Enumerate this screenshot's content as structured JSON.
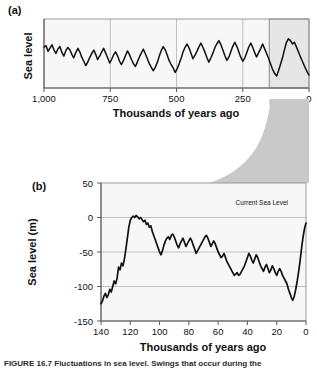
{
  "figure": {
    "caption": "FIGURE 16.7  Fluctuations in sea level. Swings that occur during the"
  },
  "panel_a": {
    "tag": "(a)",
    "ylabel": "Sea level",
    "xlabel": "Thousands of years ago",
    "xticks": [
      "1,000",
      "750",
      "500",
      "250",
      "0"
    ],
    "highlight_note": "detail-region-0-150ka"
  },
  "panel_b": {
    "tag": "(b)",
    "ylabel": "Sea level (m)",
    "xlabel": "Thousands of years ago",
    "xticks": [
      "140",
      "120",
      "100",
      "80",
      "60",
      "40",
      "20",
      "0"
    ],
    "yticks": [
      "50",
      "0",
      "-50",
      "-100",
      "-150"
    ],
    "annotation": "Current Sea Level"
  },
  "colors": {
    "curve": "#111111",
    "plot_background": "#f7f7f7",
    "gridline": "#b9b9b9",
    "frame": "#9a9a9a",
    "funnel": "#c9c9c9"
  },
  "chart_data": [
    {
      "type": "line",
      "id": "panel-a-sea-level-1myr",
      "title": "",
      "xlabel": "Thousands of years ago",
      "ylabel": "Sea level",
      "xlim": [
        1000,
        0
      ],
      "ylim": [
        -140,
        20
      ],
      "xticks": [
        1000,
        750,
        500,
        250,
        0
      ],
      "yticks": [],
      "grid": "vertical",
      "xaxis_reversed": true,
      "legend": "none",
      "highlight_region": [
        150,
        0
      ],
      "x": [
        1000,
        992,
        985,
        978,
        970,
        962,
        955,
        948,
        940,
        932,
        925,
        918,
        910,
        902,
        895,
        888,
        880,
        872,
        865,
        858,
        850,
        842,
        835,
        828,
        820,
        812,
        805,
        798,
        790,
        782,
        775,
        768,
        760,
        752,
        745,
        738,
        730,
        722,
        715,
        708,
        700,
        692,
        685,
        678,
        670,
        662,
        655,
        648,
        640,
        632,
        625,
        618,
        610,
        602,
        595,
        588,
        580,
        572,
        565,
        558,
        550,
        542,
        535,
        528,
        520,
        512,
        505,
        498,
        490,
        482,
        475,
        468,
        460,
        452,
        445,
        438,
        430,
        422,
        415,
        408,
        400,
        392,
        385,
        378,
        370,
        362,
        355,
        348,
        340,
        332,
        325,
        318,
        310,
        302,
        295,
        288,
        280,
        272,
        265,
        258,
        250,
        242,
        235,
        228,
        220,
        212,
        205,
        198,
        190,
        182,
        175,
        168,
        160,
        152,
        145,
        138,
        130,
        122,
        115,
        108,
        100,
        92,
        85,
        78,
        70,
        62,
        55,
        48,
        40,
        32,
        25,
        18,
        12,
        6,
        0
      ],
      "y": [
        -45,
        -42,
        -55,
        -48,
        -40,
        -52,
        -60,
        -50,
        -44,
        -58,
        -66,
        -54,
        -46,
        -52,
        -62,
        -70,
        -58,
        -48,
        -56,
        -68,
        -78,
        -88,
        -80,
        -70,
        -60,
        -52,
        -62,
        -74,
        -66,
        -56,
        -48,
        -58,
        -70,
        -82,
        -74,
        -64,
        -56,
        -66,
        -78,
        -86,
        -76,
        -64,
        -54,
        -62,
        -74,
        -84,
        -90,
        -80,
        -68,
        -58,
        -50,
        -60,
        -72,
        -84,
        -92,
        -100,
        -92,
        -80,
        -66,
        -54,
        -44,
        -52,
        -64,
        -76,
        -86,
        -94,
        -104,
        -96,
        -84,
        -70,
        -56,
        -46,
        -38,
        -48,
        -60,
        -72,
        -64,
        -54,
        -44,
        -36,
        -46,
        -58,
        -70,
        -80,
        -70,
        -58,
        -46,
        -38,
        -30,
        -40,
        -52,
        -64,
        -76,
        -68,
        -56,
        -44,
        -34,
        -44,
        -56,
        -68,
        -78,
        -70,
        -58,
        -46,
        -36,
        -46,
        -58,
        -68,
        -58,
        -48,
        -38,
        -48,
        -60,
        -72,
        -84,
        -96,
        -106,
        -112,
        -100,
        -86,
        -70,
        -50,
        -34,
        -26,
        -30,
        -38,
        -34,
        -44,
        -56,
        -68,
        -78,
        -88,
        -96,
        -104,
        -110,
        -70,
        -24
      ]
    },
    {
      "type": "line",
      "id": "panel-b-sea-level-140ka",
      "title": "",
      "xlabel": "Thousands of years ago",
      "ylabel": "Sea level (m)",
      "xlim": [
        140,
        0
      ],
      "ylim": [
        -150,
        50
      ],
      "xticks": [
        140,
        120,
        100,
        80,
        60,
        40,
        20,
        0
      ],
      "yticks": [
        50,
        0,
        -50,
        -100,
        -150
      ],
      "gridlines_y": [
        0,
        -50,
        -100
      ],
      "grid": "horizontal",
      "xaxis_reversed": true,
      "legend": "none",
      "annotations": [
        {
          "text": "Current Sea Level",
          "x": 12,
          "y": 5
        }
      ],
      "x": [
        140,
        139,
        138,
        137,
        136,
        135,
        134,
        133,
        132,
        131,
        130,
        129,
        128,
        127,
        126,
        125,
        124,
        123,
        122,
        121,
        120,
        119,
        118,
        117,
        116,
        115,
        114,
        113,
        112,
        111,
        110,
        109,
        108,
        107,
        106,
        105,
        104,
        103,
        102,
        101,
        100,
        99,
        98,
        97,
        96,
        95,
        94,
        93,
        92,
        91,
        90,
        89,
        88,
        87,
        86,
        85,
        84,
        83,
        82,
        81,
        80,
        79,
        78,
        77,
        76,
        75,
        74,
        73,
        72,
        71,
        70,
        69,
        68,
        67,
        66,
        65,
        64,
        63,
        62,
        61,
        60,
        59,
        58,
        57,
        56,
        55,
        54,
        53,
        52,
        51,
        50,
        49,
        48,
        47,
        46,
        45,
        44,
        43,
        42,
        41,
        40,
        39,
        38,
        37,
        36,
        35,
        34,
        33,
        32,
        31,
        30,
        29,
        28,
        27,
        26,
        25,
        24,
        23,
        22,
        21,
        20,
        19,
        18,
        17,
        16,
        15,
        14,
        13,
        12,
        11,
        10,
        9,
        8,
        7,
        6,
        5,
        4,
        3,
        2,
        1,
        0
      ],
      "y": [
        -125,
        -121,
        -114,
        -110,
        -116,
        -112,
        -104,
        -108,
        -100,
        -92,
        -96,
        -88,
        -72,
        -76,
        -66,
        -70,
        -60,
        -46,
        -30,
        -14,
        -4,
        0,
        2,
        0,
        3,
        1,
        -2,
        0,
        -3,
        -6,
        -4,
        -10,
        -8,
        -14,
        -12,
        -20,
        -26,
        -32,
        -38,
        -44,
        -50,
        -54,
        -48,
        -40,
        -34,
        -30,
        -28,
        -32,
        -26,
        -24,
        -28,
        -34,
        -40,
        -44,
        -38,
        -34,
        -30,
        -36,
        -42,
        -38,
        -34,
        -30,
        -34,
        -40,
        -46,
        -52,
        -48,
        -44,
        -40,
        -36,
        -32,
        -28,
        -26,
        -30,
        -36,
        -42,
        -38,
        -34,
        -38,
        -44,
        -50,
        -54,
        -58,
        -56,
        -52,
        -58,
        -64,
        -68,
        -72,
        -76,
        -80,
        -84,
        -82,
        -80,
        -84,
        -82,
        -78,
        -74,
        -70,
        -64,
        -58,
        -52,
        -56,
        -62,
        -66,
        -60,
        -54,
        -58,
        -64,
        -70,
        -74,
        -78,
        -72,
        -68,
        -74,
        -80,
        -76,
        -70,
        -74,
        -80,
        -84,
        -78,
        -74,
        -78,
        -84,
        -88,
        -92,
        -96,
        -104,
        -110,
        -116,
        -120,
        -114,
        -104,
        -92,
        -78,
        -62,
        -44,
        -28,
        -16,
        -8,
        -2,
        2,
        6,
        10
      ]
    }
  ]
}
